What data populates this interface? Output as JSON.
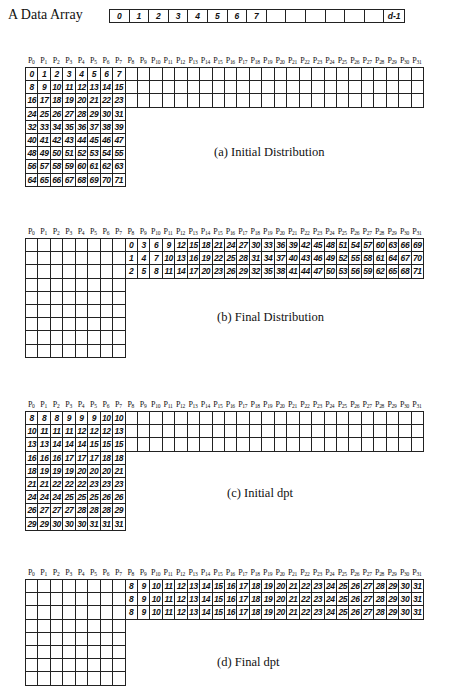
{
  "data_array": {
    "label": "A Data Array",
    "cells": [
      "0",
      "1",
      "2",
      "3",
      "4",
      "5",
      "6",
      "7",
      "",
      "",
      "",
      "",
      "",
      "",
      "d-1"
    ]
  },
  "processor_prefix": "P",
  "processor_indices": [
    "0",
    "1",
    "2",
    "3",
    "4",
    "5",
    "6",
    "7",
    "8",
    "9",
    "10",
    "11",
    "12",
    "13",
    "14",
    "15",
    "16",
    "17",
    "18",
    "19",
    "20",
    "21",
    "22",
    "23",
    "24",
    "25",
    "26",
    "27",
    "28",
    "29",
    "30",
    "31"
  ],
  "panels": [
    {
      "caption": "(a) Initial Distribution",
      "rows": [
        {
          "cols": 32,
          "start": 0,
          "values": [
            "0",
            "1",
            "2",
            "3",
            "4",
            "5",
            "6",
            "7"
          ]
        },
        {
          "cols": 32,
          "start": 0,
          "values": [
            "8",
            "9",
            "10",
            "11",
            "12",
            "13",
            "14",
            "15"
          ]
        },
        {
          "cols": 32,
          "start": 0,
          "values": [
            "16",
            "17",
            "18",
            "19",
            "20",
            "21",
            "22",
            "23"
          ]
        },
        {
          "cols": 8,
          "start": 0,
          "values": [
            "24",
            "25",
            "26",
            "27",
            "28",
            "29",
            "30",
            "31"
          ]
        },
        {
          "cols": 8,
          "start": 0,
          "values": [
            "32",
            "33",
            "34",
            "35",
            "36",
            "37",
            "38",
            "39"
          ]
        },
        {
          "cols": 8,
          "start": 0,
          "values": [
            "40",
            "41",
            "42",
            "43",
            "44",
            "45",
            "46",
            "47"
          ]
        },
        {
          "cols": 8,
          "start": 0,
          "values": [
            "48",
            "49",
            "50",
            "51",
            "52",
            "53",
            "54",
            "55"
          ]
        },
        {
          "cols": 8,
          "start": 0,
          "values": [
            "56",
            "57",
            "58",
            "59",
            "60",
            "61",
            "62",
            "63"
          ]
        },
        {
          "cols": 8,
          "start": 0,
          "values": [
            "64",
            "65",
            "66",
            "67",
            "68",
            "69",
            "70",
            "71"
          ]
        }
      ]
    },
    {
      "caption": "(b) Final Distribution",
      "rows": [
        {
          "cols": 32,
          "start": 8,
          "values": [
            "0",
            "3",
            "6",
            "9",
            "12",
            "15",
            "18",
            "21",
            "24",
            "27",
            "30",
            "33",
            "36",
            "39",
            "42",
            "45",
            "48",
            "51",
            "54",
            "57",
            "60",
            "63",
            "66",
            "69"
          ]
        },
        {
          "cols": 32,
          "start": 8,
          "values": [
            "1",
            "4",
            "7",
            "10",
            "13",
            "16",
            "19",
            "22",
            "25",
            "28",
            "31",
            "34",
            "37",
            "40",
            "43",
            "46",
            "49",
            "52",
            "55",
            "58",
            "61",
            "64",
            "67",
            "70"
          ]
        },
        {
          "cols": 32,
          "start": 8,
          "values": [
            "2",
            "5",
            "8",
            "11",
            "14",
            "17",
            "20",
            "23",
            "26",
            "29",
            "32",
            "35",
            "38",
            "41",
            "44",
            "47",
            "50",
            "53",
            "56",
            "59",
            "62",
            "65",
            "68",
            "71"
          ]
        },
        {
          "cols": 8,
          "start": 0,
          "values": []
        },
        {
          "cols": 8,
          "start": 0,
          "values": []
        },
        {
          "cols": 8,
          "start": 0,
          "values": []
        },
        {
          "cols": 8,
          "start": 0,
          "values": []
        },
        {
          "cols": 8,
          "start": 0,
          "values": []
        },
        {
          "cols": 8,
          "start": 0,
          "values": []
        }
      ]
    },
    {
      "caption": "(c) Initial dpt",
      "rows": [
        {
          "cols": 32,
          "start": 0,
          "values": [
            "8",
            "8",
            "8",
            "9",
            "9",
            "9",
            "10",
            "10"
          ]
        },
        {
          "cols": 32,
          "start": 0,
          "values": [
            "10",
            "11",
            "11",
            "11",
            "12",
            "12",
            "12",
            "13"
          ]
        },
        {
          "cols": 32,
          "start": 0,
          "values": [
            "13",
            "13",
            "14",
            "14",
            "14",
            "15",
            "15",
            "15"
          ]
        },
        {
          "cols": 8,
          "start": 0,
          "values": [
            "16",
            "16",
            "16",
            "17",
            "17",
            "17",
            "18",
            "18"
          ]
        },
        {
          "cols": 8,
          "start": 0,
          "values": [
            "18",
            "19",
            "19",
            "19",
            "20",
            "20",
            "20",
            "21"
          ]
        },
        {
          "cols": 8,
          "start": 0,
          "values": [
            "21",
            "21",
            "22",
            "22",
            "22",
            "23",
            "23",
            "23"
          ]
        },
        {
          "cols": 8,
          "start": 0,
          "values": [
            "24",
            "24",
            "24",
            "25",
            "25",
            "25",
            "26",
            "26"
          ]
        },
        {
          "cols": 8,
          "start": 0,
          "values": [
            "26",
            "27",
            "27",
            "27",
            "28",
            "28",
            "28",
            "29"
          ]
        },
        {
          "cols": 8,
          "start": 0,
          "values": [
            "29",
            "29",
            "30",
            "30",
            "30",
            "31",
            "31",
            "31"
          ]
        }
      ]
    },
    {
      "caption": "(d) Final dpt",
      "rows": [
        {
          "cols": 32,
          "start": 8,
          "values": [
            "8",
            "9",
            "10",
            "11",
            "12",
            "13",
            "14",
            "15",
            "16",
            "17",
            "18",
            "19",
            "20",
            "21",
            "22",
            "23",
            "24",
            "25",
            "26",
            "27",
            "28",
            "29",
            "30",
            "31"
          ]
        },
        {
          "cols": 32,
          "start": 8,
          "values": [
            "8",
            "9",
            "10",
            "11",
            "12",
            "13",
            "14",
            "15",
            "16",
            "17",
            "18",
            "19",
            "20",
            "21",
            "22",
            "23",
            "24",
            "25",
            "26",
            "27",
            "28",
            "29",
            "30",
            "31"
          ]
        },
        {
          "cols": 32,
          "start": 8,
          "values": [
            "8",
            "9",
            "10",
            "11",
            "12",
            "13",
            "14",
            "15",
            "16",
            "17",
            "18",
            "19",
            "20",
            "21",
            "22",
            "23",
            "24",
            "25",
            "26",
            "27",
            "28",
            "29",
            "30",
            "31"
          ]
        },
        {
          "cols": 8,
          "start": 0,
          "values": []
        },
        {
          "cols": 8,
          "start": 0,
          "values": []
        },
        {
          "cols": 8,
          "start": 0,
          "values": []
        },
        {
          "cols": 8,
          "start": 0,
          "values": []
        },
        {
          "cols": 8,
          "start": 0,
          "values": []
        }
      ]
    }
  ]
}
